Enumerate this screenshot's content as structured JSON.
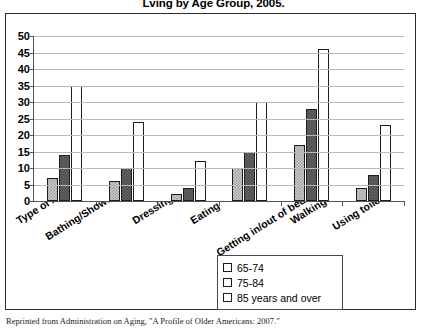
{
  "title": "Lving by Age Group, 2005.",
  "footer": "Reprinted from Administration on Aging, \"A Profile of Older Americans: 2007.\"",
  "legend": {
    "items": [
      {
        "label": "65-74",
        "color": "#c9c9c9"
      },
      {
        "label": "75-84",
        "color": "#4a4a4a"
      },
      {
        "label": "85 years and over",
        "color": "#ffffff"
      }
    ]
  },
  "axis_title": "Type of ADL",
  "chart_data": {
    "type": "bar",
    "title": "Lving by Age Group, 2005.",
    "xlabel": "Type of ADL",
    "ylabel": "",
    "ylim": [
      0,
      50
    ],
    "ytick_step": 5,
    "yticks": [
      50,
      45,
      40,
      35,
      30,
      25,
      20,
      15,
      10,
      5,
      0
    ],
    "grid": true,
    "legend_position": "bottom-right",
    "categories": [
      "Bathing/Showering",
      "Dressing",
      "Eating",
      "Getting in/out of bed/chairs",
      "Walking",
      "Using toilet"
    ],
    "series": [
      {
        "name": "65-74",
        "color": "#c9c9c9",
        "values": [
          7,
          6,
          2,
          10,
          17,
          4
        ]
      },
      {
        "name": "75-84",
        "color": "#4a4a4a",
        "values": [
          14,
          10,
          4,
          15,
          28,
          8
        ]
      },
      {
        "name": "85 years and over",
        "color": "#ffffff",
        "values": [
          35,
          24,
          12,
          30,
          46,
          23
        ]
      }
    ]
  }
}
